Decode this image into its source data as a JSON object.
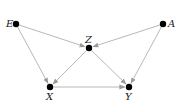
{
  "diagram": {
    "type": "directed-acyclic-graph",
    "nodes": [
      {
        "id": "E",
        "label": "E",
        "x": 16,
        "y": 24,
        "label_dx": -10,
        "label_dy": 3
      },
      {
        "id": "A",
        "label": "A",
        "x": 163,
        "y": 24,
        "label_dx": 5,
        "label_dy": 3
      },
      {
        "id": "Z",
        "label": "Z",
        "x": 89,
        "y": 48,
        "label_dx": -4,
        "label_dy": -5
      },
      {
        "id": "X",
        "label": "X",
        "x": 50,
        "y": 87,
        "label_dx": -4,
        "label_dy": 13
      },
      {
        "id": "Y",
        "label": "Y",
        "x": 129,
        "y": 87,
        "label_dx": -4,
        "label_dy": 13
      }
    ],
    "edges": [
      {
        "from": "E",
        "to": "Z"
      },
      {
        "from": "E",
        "to": "X"
      },
      {
        "from": "A",
        "to": "Z"
      },
      {
        "from": "A",
        "to": "Y"
      },
      {
        "from": "Z",
        "to": "X"
      },
      {
        "from": "Z",
        "to": "Y"
      },
      {
        "from": "X",
        "to": "Y"
      }
    ],
    "colors": {
      "edge": "#b8b8b8",
      "node": "#000000",
      "label": "#222222"
    }
  }
}
